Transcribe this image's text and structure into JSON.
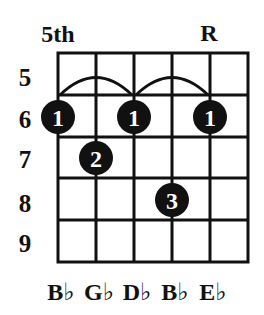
{
  "diagram": {
    "position_label": "5th",
    "root_marker": "R",
    "root_string_index": 4,
    "fret_numbers": [
      "5",
      "6",
      "7",
      "8",
      "9"
    ],
    "string_labels": [
      "B♭",
      "G♭",
      "D♭",
      "B♭",
      "E♭"
    ],
    "num_strings": 6,
    "num_frets": 5,
    "colors": {
      "line": "#111111",
      "dot": "#111111",
      "dot_text": "#ffffff",
      "background": "#ffffff"
    },
    "barre_arcs": [
      {
        "from_string": 0,
        "to_string": 2,
        "fret": "5"
      },
      {
        "from_string": 2,
        "to_string": 4,
        "fret": "5"
      }
    ],
    "finger_dots": [
      {
        "string": 0,
        "fret": "6",
        "finger": "1"
      },
      {
        "string": 2,
        "fret": "6",
        "finger": "1"
      },
      {
        "string": 4,
        "fret": "6",
        "finger": "1"
      },
      {
        "string": 1,
        "fret": "7",
        "finger": "2"
      },
      {
        "string": 3,
        "fret": "8",
        "finger": "3"
      }
    ]
  }
}
